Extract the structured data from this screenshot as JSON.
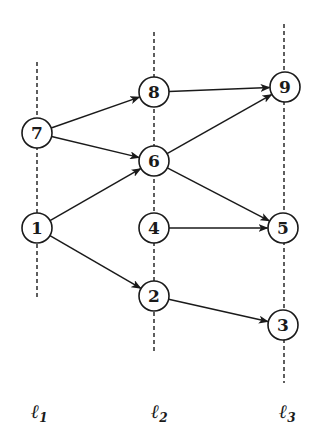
{
  "diagram": {
    "title": "",
    "levels": [
      {
        "id": "l1",
        "symbol": "ℓ",
        "subscript": "1",
        "x": 37,
        "line_top": 62,
        "line_bottom": 297,
        "label_x": 37,
        "label_y": 418
      },
      {
        "id": "l2",
        "symbol": "ℓ",
        "subscript": "2",
        "x": 154,
        "line_top": 32,
        "line_bottom": 352,
        "label_x": 157,
        "label_y": 418
      },
      {
        "id": "l3",
        "symbol": "ℓ",
        "subscript": "3",
        "x": 284,
        "line_top": 24,
        "line_bottom": 383,
        "label_x": 285,
        "label_y": 418
      }
    ],
    "nodes": [
      {
        "id": "7",
        "label": "7",
        "level": "l1",
        "x": 37,
        "y": 133
      },
      {
        "id": "1",
        "label": "1",
        "level": "l1",
        "x": 37,
        "y": 228
      },
      {
        "id": "8",
        "label": "8",
        "level": "l2",
        "x": 154,
        "y": 92
      },
      {
        "id": "6",
        "label": "6",
        "level": "l2",
        "x": 154,
        "y": 161
      },
      {
        "id": "4",
        "label": "4",
        "level": "l2",
        "x": 154,
        "y": 228
      },
      {
        "id": "2",
        "label": "2",
        "level": "l2",
        "x": 154,
        "y": 296
      },
      {
        "id": "9",
        "label": "9",
        "level": "l3",
        "x": 285,
        "y": 87
      },
      {
        "id": "5",
        "label": "5",
        "level": "l3",
        "x": 283,
        "y": 228
      },
      {
        "id": "3",
        "label": "3",
        "level": "l3",
        "x": 283,
        "y": 325
      }
    ],
    "edges": [
      {
        "from": "7",
        "to": "8"
      },
      {
        "from": "7",
        "to": "6"
      },
      {
        "from": "1",
        "to": "6"
      },
      {
        "from": "1",
        "to": "2"
      },
      {
        "from": "8",
        "to": "9"
      },
      {
        "from": "6",
        "to": "9"
      },
      {
        "from": "6",
        "to": "5"
      },
      {
        "from": "4",
        "to": "5"
      },
      {
        "from": "2",
        "to": "3"
      }
    ],
    "node_radius": 15
  }
}
